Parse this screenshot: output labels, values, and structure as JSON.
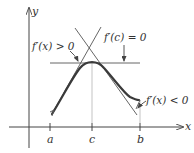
{
  "diagram": {
    "axes": {
      "x_label": "x",
      "y_label": "y"
    },
    "ticks": [
      {
        "label": "a",
        "x": 50
      },
      {
        "label": "c",
        "x": 92
      },
      {
        "label": "b",
        "x": 140
      }
    ],
    "annotations": {
      "positive_slope": "f′(x) > 0",
      "zero_slope": "f′(c) = 0",
      "negative_slope": "f′(x) < 0"
    },
    "colors": {
      "curve": "#3a3a3a",
      "lines": "#555555",
      "guides": "#aaaaaa"
    }
  }
}
